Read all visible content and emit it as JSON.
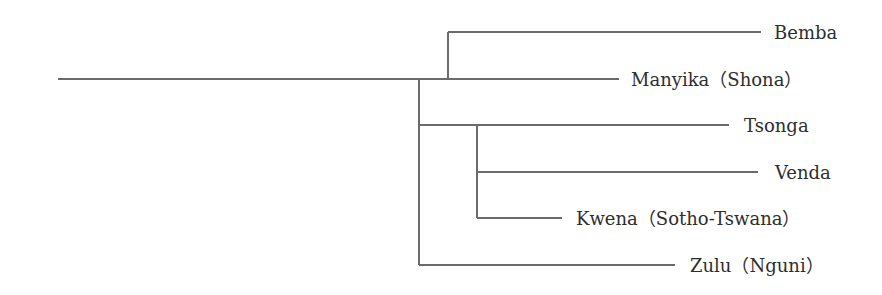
{
  "diagram": {
    "type": "phylogenetic-tree",
    "orientation": "left-to-right",
    "colors": {
      "line": "#6b6b6b",
      "text": "#2e2e2e",
      "background": "#ffffff"
    },
    "leaves": [
      {
        "id": "bemba",
        "label": "Bemba"
      },
      {
        "id": "manyika",
        "label": "Manyika（Shona）"
      },
      {
        "id": "tsonga",
        "label": "Tsonga"
      },
      {
        "id": "venda",
        "label": "Venda"
      },
      {
        "id": "kwena",
        "label": "Kwena（Sotho-Tswana）"
      },
      {
        "id": "zulu",
        "label": "Zulu（Nguni）"
      }
    ],
    "structure": "(Bemba, (Manyika(Shona), (Tsonga, (Venda, Kwena(Sotho-Tswana))), Zulu(Nguni)))"
  }
}
